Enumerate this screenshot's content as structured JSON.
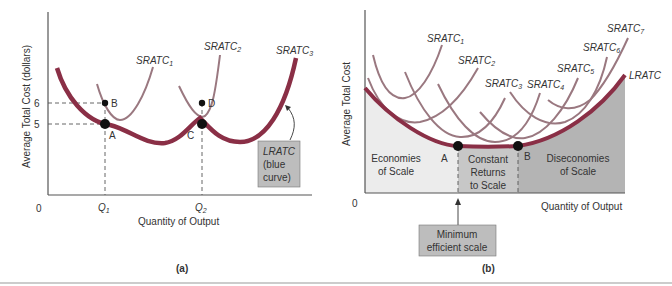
{
  "panel_a": {
    "caption": "(a)",
    "ylabel": "Average Total Cost (dollars)",
    "xlabel": "Quantity of Output",
    "origin": "0",
    "y_ticks": [
      "6",
      "5"
    ],
    "x_ticks": [
      "Q1",
      "Q2"
    ],
    "curves": [
      "SRATC1",
      "SRATC2",
      "SRATC3"
    ],
    "points": [
      "A",
      "B",
      "C",
      "D"
    ],
    "note_line1": "LRATC",
    "note_line2": "(blue",
    "note_line3": "curve)"
  },
  "panel_b": {
    "caption": "(b)",
    "ylabel": "Average Total Cost",
    "xlabel": "Quantity of Output",
    "origin": "0",
    "curves": [
      "SRATC1",
      "SRATC2",
      "SRATC3",
      "SRATC4",
      "SRATC5",
      "SRATC6",
      "SRATC7"
    ],
    "lratc": "LRATC",
    "points": [
      "A",
      "B"
    ],
    "regions": {
      "economies_1": "Economies",
      "economies_2": "of Scale",
      "constant_1": "Constant",
      "constant_2": "Returns",
      "constant_3": "to Scale",
      "dis_1": "Diseconomies",
      "dis_2": "of Scale"
    },
    "mes_line1": "Minimum",
    "mes_line2": "efficient scale"
  },
  "colors": {
    "lratc": "#8a2f46",
    "srtc": "#9a7880",
    "axis": "#555555",
    "box_fill": "#bdbdbd",
    "region_light": "#ececec",
    "region_mid": "#c7c7c7",
    "region_dark": "#b4b4b4"
  }
}
